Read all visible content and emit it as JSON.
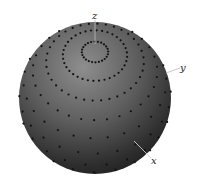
{
  "diagram": {
    "type": "sphere-with-point-grid",
    "axes": {
      "z": "z",
      "y": "y",
      "x": "x"
    },
    "sphere": {
      "center": [
        95,
        98
      ],
      "radius": 76,
      "fill_dark": "#1e1e1e",
      "fill_light": "#8a8a8a",
      "point_color": "#141414"
    }
  }
}
